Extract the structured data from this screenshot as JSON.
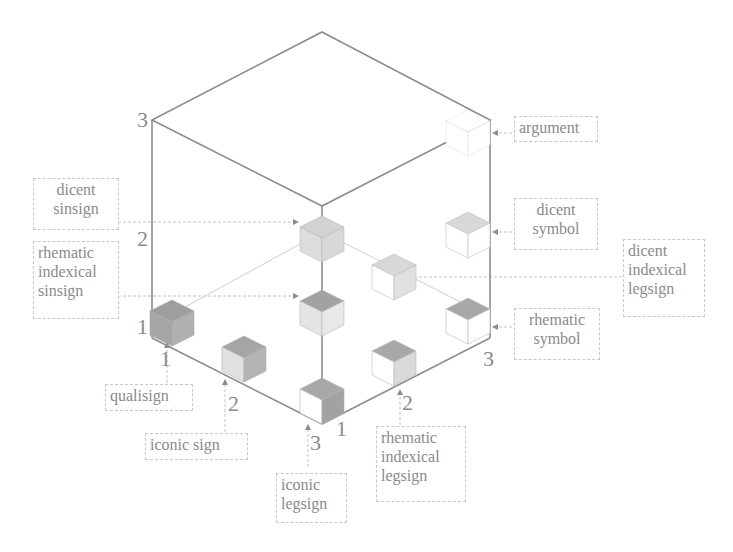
{
  "colors": {
    "edge": "#8c8c8c",
    "label_border": "#c8c8c8",
    "text": "#8a8a8a",
    "dark": "#9a9a9a",
    "mid": "#c4c4c4",
    "light": "#e2e2e2"
  },
  "axis_ticks": {
    "vertical": [
      "1",
      "2",
      "3"
    ],
    "left_bottom": [
      "1",
      "2",
      "3"
    ],
    "right_bottom": [
      "1",
      "2",
      "3"
    ]
  },
  "labels": {
    "argument": "argument",
    "dicent_symbol": "dicent\nsymbol",
    "dicent_indexical_legsign": "dicent\nindexical\nlegsign",
    "rhematic_symbol": "rhematic\nsymbol",
    "dicent_sinsign": "dicent\nsinsign",
    "rhematic_indexical_sinsign": "rhematic\nindexical\nsinsign",
    "qualisign": "qualisign",
    "iconic_sign": "iconic sign",
    "iconic_legsign": "iconic\nlegsign",
    "rhematic_indexical_legsign": "rhematic\nindexical\nlegsign"
  }
}
